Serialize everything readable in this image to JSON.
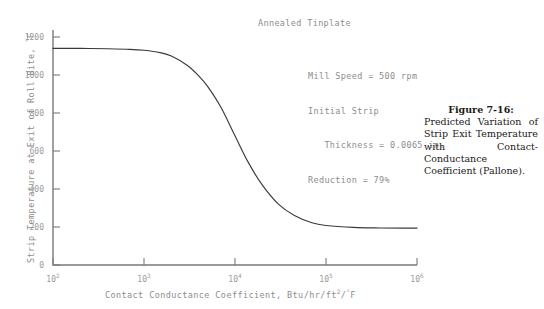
{
  "chart_data": {
    "type": "line",
    "title": "",
    "xlabel": "Contact Conductance Coefficient, Btu/hr/ft²/°F",
    "ylabel": "Strip Temperature at Exit of Roll Bite, °F",
    "xscale": "log",
    "xlim": [
      100,
      1000000
    ],
    "ylim": [
      0,
      1300
    ],
    "grid": false,
    "legend": null,
    "x_tick_labels": [
      "10",
      "10",
      "10",
      "10",
      "10"
    ],
    "x_tick_exponents": [
      "2",
      "3",
      "4",
      "5",
      "6"
    ],
    "x_tick_values": [
      100,
      1000,
      10000,
      100000,
      1000000
    ],
    "y_tick_labels": [
      "0",
      "200",
      "400",
      "600",
      "800",
      "1000",
      "1200"
    ],
    "y_tick_values": [
      0,
      200,
      400,
      600,
      800,
      1000,
      1200
    ],
    "series": [
      {
        "name": "Predicted strip exit temperature",
        "x": [
          100,
          200,
          400,
          700,
          1000,
          1500,
          2000,
          3000,
          4000,
          5000,
          7000,
          10000,
          14000,
          20000,
          30000,
          45000,
          70000,
          100000,
          200000,
          400000,
          700000,
          1000000
        ],
        "y": [
          1140,
          1140,
          1138,
          1135,
          1130,
          1118,
          1100,
          1050,
          995,
          940,
          830,
          680,
          540,
          420,
          320,
          260,
          222,
          208,
          198,
          195,
          194,
          194
        ]
      }
    ],
    "annotations": [
      {
        "name": "material-note",
        "text": "Annealed Tinplate"
      },
      {
        "name": "mill-speed",
        "text": "Mill Speed = 500 rpm"
      },
      {
        "name": "initial-strip",
        "text": "Initial Strip"
      },
      {
        "name": "thickness",
        "text": "   Thickness = 0.0065 in."
      },
      {
        "name": "reduction",
        "text": "Reduction = 79%"
      }
    ],
    "curve_color": "#3a3a3a",
    "axis_color": "#7a7a7a"
  },
  "axes": {
    "x_title_main": "Contact Conductance Coefficient, Btu/hr/ft",
    "x_title_sup1": "2",
    "x_title_mid": "/",
    "x_title_sup2": "°",
    "x_title_end": "F",
    "y_title_main": "Strip Temperature at Exit of Roll Bite, ",
    "y_title_sup": "°",
    "y_title_end": "F"
  },
  "annotations": {
    "material": "Annealed Tinplate",
    "params_line1": "Mill Speed = 500 rpm",
    "params_line2": "Initial Strip",
    "params_line3": "   Thickness = 0.0065 in.",
    "params_line4": "Reduction = 79%"
  },
  "caption": {
    "heading": "Figure 7-16:",
    "body": "Predicted Variation of Strip Exit Temperature with Contact-Conductance Coefficient (Pallone)."
  },
  "colors": {
    "background": "#ffffff",
    "curve": "#3a3a3a",
    "axis": "#7a7a7a",
    "tick_text": "#9a9a9a",
    "annotation_text": "#8d8d8d",
    "caption_text": "#1a1a1a"
  }
}
